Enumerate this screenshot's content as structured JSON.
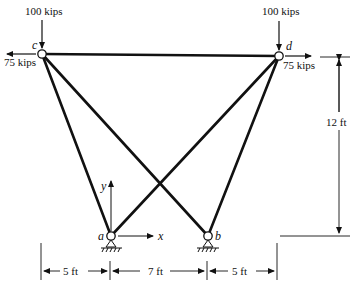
{
  "diagram": {
    "type": "truss",
    "nodes": {
      "c": {
        "label": "c",
        "x": 42,
        "y": 54
      },
      "d": {
        "label": "d",
        "x": 279,
        "y": 56
      },
      "a": {
        "label": "a",
        "x": 111,
        "y": 236
      },
      "b": {
        "label": "b",
        "x": 208,
        "y": 236
      }
    },
    "members": [
      [
        "c",
        "d"
      ],
      [
        "c",
        "a"
      ],
      [
        "c",
        "b"
      ],
      [
        "d",
        "a"
      ],
      [
        "d",
        "b"
      ]
    ],
    "loads": {
      "c_vertical": "100 kips",
      "c_horizontal": "75 kips",
      "d_vertical": "100 kips",
      "d_horizontal": "75 kips"
    },
    "axes": {
      "x_label": "x",
      "y_label": "y"
    },
    "dimensions": {
      "left_span": "5 ft",
      "middle_span": "7 ft",
      "right_span": "5 ft",
      "height": "12 ft"
    },
    "colors": {
      "line": "#111111",
      "background": "#ffffff"
    }
  }
}
